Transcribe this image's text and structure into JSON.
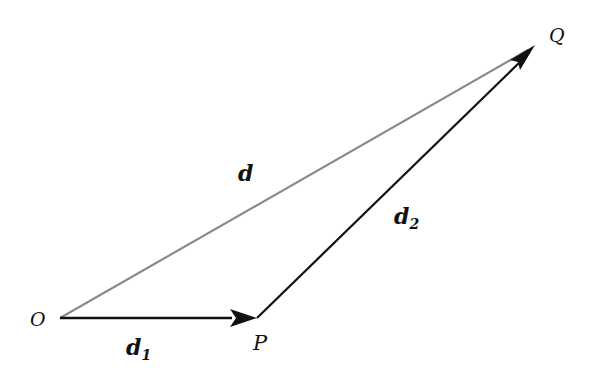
{
  "diagram": {
    "type": "vector-addition-triangle",
    "points": {
      "O": {
        "label": "O",
        "x": 60,
        "y": 318
      },
      "P": {
        "label": "P",
        "x": 257,
        "y": 318
      },
      "Q": {
        "label": "Q",
        "x": 535,
        "y": 45
      }
    },
    "vectors": [
      {
        "name": "d1",
        "label": "d",
        "subscript": "1",
        "from": "O",
        "to": "P",
        "color": "#111111"
      },
      {
        "name": "d2",
        "label": "d",
        "subscript": "2",
        "from": "P",
        "to": "Q",
        "color": "#111111"
      },
      {
        "name": "d",
        "label": "d",
        "subscript": "",
        "from": "O",
        "to": "Q",
        "color": "#8a8a8a"
      }
    ]
  },
  "labels": {
    "O": "O",
    "P": "P",
    "Q": "Q",
    "d": "d",
    "d1_main": "d",
    "d1_sub": "1",
    "d2_main": "d",
    "d2_sub": "2"
  }
}
